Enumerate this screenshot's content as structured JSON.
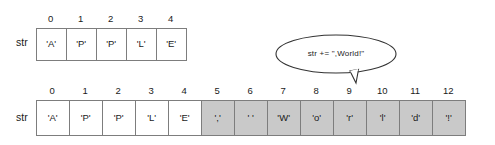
{
  "diagram": {
    "colors": {
      "border": "#7d7d7d",
      "cell_unchanged": "#ffffff",
      "cell_appended": "#c9c9c9",
      "text": "#1a1a1a",
      "background": "#ffffff"
    },
    "arrays": [
      {
        "id": "before",
        "label": "str",
        "cells": [
          {
            "index": "0",
            "value": "'A'",
            "shaded": false
          },
          {
            "index": "1",
            "value": "'P'",
            "shaded": false
          },
          {
            "index": "2",
            "value": "'P'",
            "shaded": false
          },
          {
            "index": "3",
            "value": "'L'",
            "shaded": false
          },
          {
            "index": "4",
            "value": "'E'",
            "shaded": false
          }
        ]
      },
      {
        "id": "after",
        "label": "str",
        "cells": [
          {
            "index": "0",
            "value": "'A'",
            "shaded": false
          },
          {
            "index": "1",
            "value": "'P'",
            "shaded": false
          },
          {
            "index": "2",
            "value": "'P'",
            "shaded": false
          },
          {
            "index": "3",
            "value": "'L'",
            "shaded": false
          },
          {
            "index": "4",
            "value": "'E'",
            "shaded": false
          },
          {
            "index": "5",
            "value": "','",
            "shaded": true
          },
          {
            "index": "6",
            "value": "' '",
            "shaded": true
          },
          {
            "index": "7",
            "value": "'W'",
            "shaded": true
          },
          {
            "index": "8",
            "value": "'o'",
            "shaded": true
          },
          {
            "index": "9",
            "value": "'r'",
            "shaded": true
          },
          {
            "index": "10",
            "value": "'l'",
            "shaded": true
          },
          {
            "index": "11",
            "value": "'d'",
            "shaded": true
          },
          {
            "index": "12",
            "value": "'!'",
            "shaded": true
          }
        ]
      }
    ],
    "callout": {
      "text": "str += \",World!\""
    }
  }
}
